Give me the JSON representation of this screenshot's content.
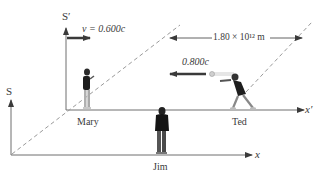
{
  "diagram": {
    "frames": {
      "S": {
        "label": "S",
        "axis_label": "x"
      },
      "S_prime": {
        "label": "S′",
        "axis_label": "x′"
      }
    },
    "frame_velocity": {
      "symbol": "v",
      "text": "v = 0.600c"
    },
    "projectile_velocity": {
      "text": "0.800c"
    },
    "distance": {
      "text": "1.80 × 10¹² m"
    },
    "observers": [
      {
        "name": "Mary",
        "frame": "S′"
      },
      {
        "name": "Ted",
        "frame": "S′"
      },
      {
        "name": "Jim",
        "frame": "S"
      }
    ],
    "colors": {
      "line": "#6e6e6e",
      "arrow": "#3a3a3a",
      "dashed": "#9a9a9a",
      "text": "#3a3a3a"
    }
  }
}
